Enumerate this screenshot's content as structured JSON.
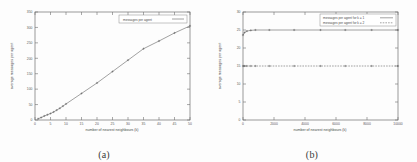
{
  "figure": {
    "panels": [
      {
        "caption": "(a)",
        "chart_data": {
          "type": "line",
          "title": "",
          "xlabel": "number of nearest neighbours (k)",
          "ylabel": "average messages per agent",
          "xlim": [
            0,
            50
          ],
          "ylim": [
            0,
            350
          ],
          "xticks": [
            0,
            5,
            10,
            15,
            20,
            25,
            30,
            35,
            40,
            45,
            50
          ],
          "yticks": [
            0,
            50,
            100,
            150,
            200,
            250,
            300,
            350
          ],
          "grid": false,
          "legend_position": "top-right",
          "series": [
            {
              "name": "messages per agent",
              "x": [
                1,
                2,
                3,
                4,
                5,
                6,
                7,
                8,
                9,
                10,
                15,
                20,
                25,
                30,
                35,
                40,
                45,
                50
              ],
              "values": [
                4,
                8,
                13,
                17,
                21,
                26,
                32,
                38,
                45,
                52,
                86,
                120,
                157,
                194,
                231,
                256,
                282,
                305
              ]
            }
          ]
        }
      },
      {
        "caption": "(b)",
        "chart_data": {
          "type": "line",
          "title": "",
          "xlabel": "number of nearest neighbours (k)",
          "ylabel": "average messages per agent",
          "xlim": [
            0,
            10000
          ],
          "ylim": [
            0,
            30
          ],
          "xticks": [
            0,
            2000,
            4000,
            6000,
            8000,
            10000
          ],
          "yticks": [
            0,
            5,
            10,
            15,
            20,
            25,
            30
          ],
          "grid": false,
          "legend_position": "top-right",
          "series": [
            {
              "name": "messages per agent for k = 1",
              "x": [
                0,
                100,
                250,
                500,
                800,
                1700,
                3300,
                5000,
                6600,
                8300,
                10000
              ],
              "values": [
                23.6,
                24.3,
                24.7,
                24.9,
                25.0,
                25.0,
                25.0,
                25.0,
                25.0,
                25.0,
                25.0
              ]
            },
            {
              "name": "messages per agent for k = 2",
              "x": [
                0,
                100,
                250,
                500,
                800,
                1700,
                3300,
                5000,
                6600,
                8300,
                10000
              ],
              "values": [
                15.0,
                15.0,
                15.0,
                15.0,
                15.0,
                15.0,
                15.0,
                15.0,
                15.0,
                15.0,
                15.0
              ]
            }
          ]
        }
      }
    ]
  }
}
